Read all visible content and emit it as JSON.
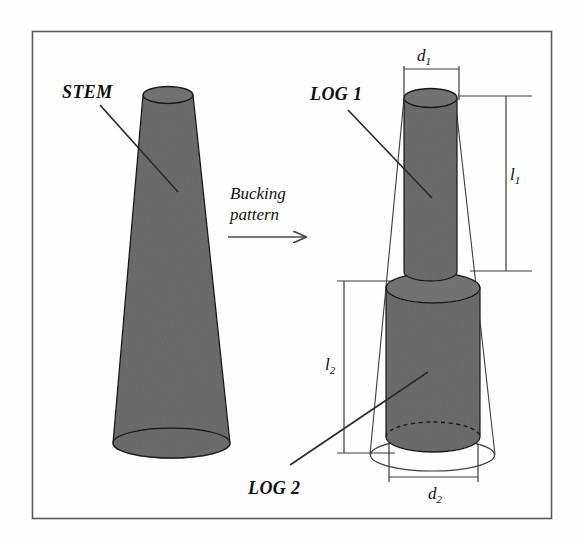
{
  "figure": {
    "background_color": "#fefefe",
    "border_color": "#5a5a5a",
    "fill_color": "#6e6e6e",
    "outline_color": "#1a1a1a"
  },
  "labels": {
    "stem": "STEM",
    "log1": "LOG 1",
    "log2": "LOG 2"
  },
  "caption": {
    "line1": "Bucking",
    "line2": "pattern"
  },
  "dimensions": {
    "d1": {
      "symbol": "d",
      "subscript": "1"
    },
    "l1": {
      "symbol": "l",
      "subscript": "1"
    },
    "l2": {
      "symbol": "l",
      "subscript": "2"
    },
    "d2": {
      "symbol": "d",
      "subscript": "2"
    }
  },
  "icons": {
    "arrow": "right-arrow-icon"
  }
}
